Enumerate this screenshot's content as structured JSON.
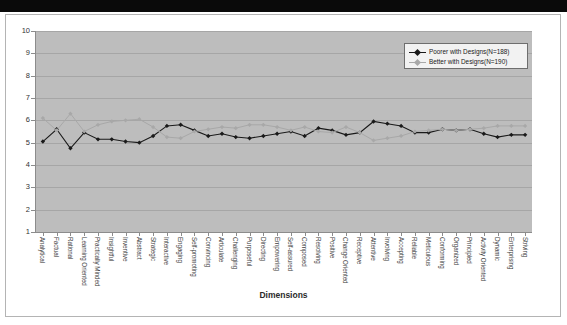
{
  "figure": {
    "x_axis_title": "Dimensions"
  },
  "legend": {
    "entries": [
      {
        "label": "Poorer with Designs",
        "n_text": "(N=188)",
        "color": "#1a1a1a",
        "marker": "filled-diamond"
      },
      {
        "label": "Better with Designs",
        "n_text": "(N=190)",
        "color": "#a8a8a8",
        "marker": "filled-diamond"
      }
    ]
  },
  "chart_data": {
    "type": "line",
    "title": "",
    "xlabel": "Dimensions",
    "ylabel": "",
    "ylim": [
      1,
      10
    ],
    "yticks": [
      1,
      2,
      3,
      4,
      5,
      6,
      7,
      8,
      9,
      10
    ],
    "grid": true,
    "legend_position": "top-right",
    "plot_background": "#bdbdbd",
    "categories": [
      "Analytical",
      "Factual",
      "Rational",
      "Learning Oriented",
      "Practically Minded",
      "Insightful",
      "Inventive",
      "Abstract",
      "Strategic",
      "Interactive",
      "Engaging",
      "Self-promoting",
      "Convincing",
      "Articulate",
      "Challenging",
      "Purposeful",
      "Directing",
      "Empowering",
      "Self-assured",
      "Composed",
      "Resolving",
      "Positive",
      "Change Oriented",
      "Receptive",
      "Attentive",
      "Involving",
      "Accepting",
      "Reliable",
      "Meticulous",
      "Conforming",
      "Organized",
      "Principled",
      "Activity Oriented",
      "Dynamic",
      "Enterprising",
      "Striving"
    ],
    "series": [
      {
        "name": "Poorer with Designs (N=188)",
        "color": "#1a1a1a",
        "values": [
          5.05,
          5.6,
          4.75,
          5.45,
          5.15,
          5.15,
          5.05,
          5.0,
          5.3,
          5.75,
          5.8,
          5.55,
          5.3,
          5.4,
          5.25,
          5.2,
          5.3,
          5.4,
          5.5,
          5.3,
          5.65,
          5.55,
          5.35,
          5.45,
          5.95,
          5.85,
          5.75,
          5.45,
          5.45,
          5.6,
          5.55,
          5.6,
          5.4,
          5.25,
          5.35,
          5.35
        ]
      },
      {
        "name": "Better with Designs (N=190)",
        "color": "#a8a8a8",
        "values": [
          6.1,
          5.55,
          6.3,
          5.5,
          5.8,
          5.95,
          6.0,
          6.05,
          5.7,
          5.25,
          5.2,
          5.5,
          5.6,
          5.7,
          5.65,
          5.8,
          5.8,
          5.7,
          5.55,
          5.7,
          5.5,
          5.45,
          5.7,
          5.45,
          5.1,
          5.2,
          5.3,
          5.5,
          5.55,
          5.6,
          5.55,
          5.6,
          5.65,
          5.75,
          5.75,
          5.75
        ]
      }
    ]
  }
}
